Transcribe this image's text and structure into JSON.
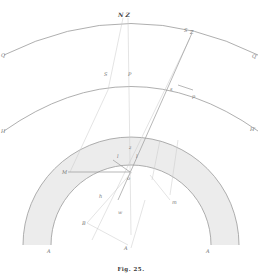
{
  "figure": {
    "caption": "Fig. 25.",
    "labels": {
      "top_NZ": "N Z",
      "outer_left": "Q",
      "outer_right": "Q'",
      "mid_left": "H",
      "mid_right": "H'",
      "mid_S": "S",
      "mid_P": "P",
      "right_S": "S",
      "right_Z": "Z",
      "right_s": "s",
      "right_p": "p",
      "ring_M": "M",
      "ring_l1": "l",
      "ring_l2": "l",
      "ring_z": "z",
      "center_o": "o",
      "ring_m": "m",
      "lower_h": "h",
      "lower_w": "w",
      "lower_B": "B",
      "lower_A": "A",
      "bottom_A_left": "A",
      "bottom_A_right": "A"
    },
    "colors": {
      "line": "#9a9a9a",
      "faint_line": "#c8c8c8",
      "ring_fill": "#ececec",
      "text": "#777777"
    }
  }
}
